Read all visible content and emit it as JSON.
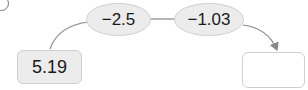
{
  "diagram": {
    "start_value": "5.19",
    "operations": [
      {
        "label": "−2.5"
      },
      {
        "label": "−1.03"
      }
    ],
    "result_value": ""
  },
  "colors": {
    "node_fill": "#ececec",
    "node_border": "#d0d0d0",
    "connector": "#888888"
  }
}
